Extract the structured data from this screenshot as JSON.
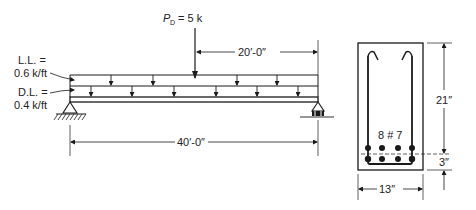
{
  "beam": {
    "live_load_label_1": "L.L. =",
    "live_load_label_2": "0.6 k/ft",
    "dead_load_label_1": "D.L. =",
    "dead_load_label_2": "0.4 k/ft",
    "point_load_symbol": "P",
    "point_load_subscript": "D",
    "point_load_value": "= 5 k",
    "dim_point_load_location": "20′-0″",
    "dim_span": "40′-0″"
  },
  "section": {
    "rebar_label": "8 # 7",
    "dim_effective_depth": "21″",
    "dim_bottom": "3″",
    "dim_width": "13″"
  }
}
